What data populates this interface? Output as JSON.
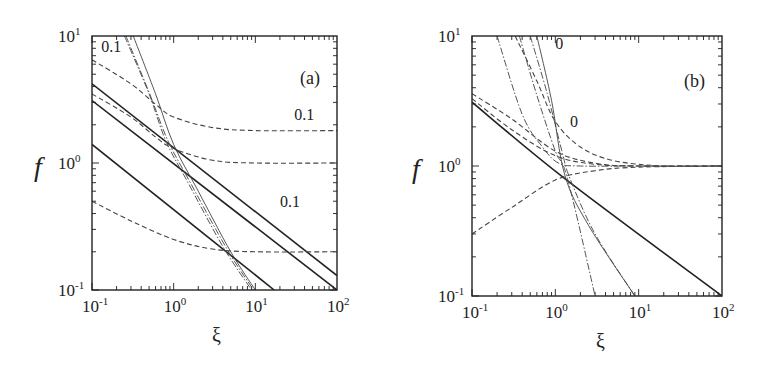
{
  "chart_data": [
    {
      "type": "line",
      "panel_label": "(a)",
      "xscale": "log",
      "yscale": "log",
      "xlabel": "ξ",
      "ylabel": "f",
      "xlim": [
        0.1,
        100
      ],
      "ylim": [
        0.1,
        10
      ],
      "xticks": [
        "10-1",
        "100",
        "101",
        "102"
      ],
      "yticks": [
        "10-1",
        "100",
        "101"
      ],
      "annotations": [
        {
          "text": "0.1",
          "x": 0.13,
          "y": 7.5
        },
        {
          "text": "0.1",
          "x": 30,
          "y": 2.2
        },
        {
          "text": "0.1",
          "x": 20,
          "y": 0.45
        }
      ],
      "series": [
        {
          "name": "solid-1",
          "style": "solid",
          "x": [
            0.1,
            100
          ],
          "y": [
            4.2,
            0.13
          ]
        },
        {
          "name": "solid-2",
          "style": "solid",
          "x": [
            0.1,
            100
          ],
          "y": [
            3.1,
            0.1
          ]
        },
        {
          "name": "solid-3",
          "style": "solid",
          "x": [
            0.1,
            17
          ],
          "y": [
            1.4,
            0.1
          ]
        },
        {
          "name": "dashed-1",
          "style": "dashed",
          "x": [
            0.1,
            0.3,
            0.6,
            1,
            3,
            10,
            100
          ],
          "y": [
            6.5,
            4.2,
            2.9,
            2.3,
            1.9,
            1.8,
            1.8
          ]
        },
        {
          "name": "dashed-2",
          "style": "dashed",
          "x": [
            0.1,
            0.3,
            0.6,
            1,
            3,
            10,
            100
          ],
          "y": [
            3.5,
            2.3,
            1.6,
            1.3,
            1.05,
            1.0,
            1.0
          ]
        },
        {
          "name": "dashed-3",
          "style": "dashed",
          "x": [
            0.1,
            0.3,
            1,
            3,
            10,
            100
          ],
          "y": [
            0.5,
            0.35,
            0.25,
            0.21,
            0.2,
            0.2
          ]
        },
        {
          "name": "dashdot-1",
          "style": "dashdot",
          "x": [
            0.25,
            0.5,
            0.8,
            1.5,
            4,
            9
          ],
          "y": [
            10,
            3.5,
            1.5,
            0.7,
            0.22,
            0.1
          ]
        },
        {
          "name": "dashdot-2",
          "style": "dashdot",
          "x": [
            0.26,
            0.5,
            0.85,
            1.6,
            4.5,
            9.5
          ],
          "y": [
            10,
            3.6,
            1.5,
            0.7,
            0.21,
            0.1
          ]
        },
        {
          "name": "thin-solid",
          "style": "thin",
          "x": [
            0.32,
            0.6,
            1.0,
            2,
            5,
            10
          ],
          "y": [
            10,
            3.5,
            1.4,
            0.6,
            0.2,
            0.1
          ]
        }
      ]
    },
    {
      "type": "line",
      "panel_label": "(b)",
      "xscale": "log",
      "yscale": "log",
      "xlabel": "ξ",
      "ylabel": "f",
      "xlim": [
        0.1,
        100
      ],
      "ylim": [
        0.1,
        10
      ],
      "xticks": [
        "10-1",
        "100",
        "101",
        "102"
      ],
      "yticks": [
        "10-1",
        "100",
        "101"
      ],
      "annotations": [
        {
          "text": "0",
          "x": 1.0,
          "y": 8.0
        },
        {
          "text": "0",
          "x": 1.5,
          "y": 2.0
        }
      ],
      "series": [
        {
          "name": "solid",
          "style": "solid",
          "x": [
            0.1,
            1.3,
            100
          ],
          "y": [
            3.1,
            0.8,
            0.1
          ]
        },
        {
          "name": "dashed-upper-1",
          "style": "dashed",
          "x": [
            0.33,
            0.6,
            1,
            2,
            5,
            20,
            100
          ],
          "y": [
            10,
            4.5,
            2.2,
            1.4,
            1.1,
            1.0,
            1.0
          ]
        },
        {
          "name": "dashed-upper-2",
          "style": "dashed",
          "x": [
            0.1,
            0.3,
            1,
            3,
            10,
            100
          ],
          "y": [
            3.6,
            2.3,
            1.3,
            1.05,
            1.0,
            1.0
          ]
        },
        {
          "name": "dashed-upper-3",
          "style": "dashed",
          "x": [
            0.1,
            0.3,
            1,
            3,
            10,
            100
          ],
          "y": [
            3.3,
            1.9,
            1.2,
            1.03,
            1.0,
            1.0
          ]
        },
        {
          "name": "dashed-lower",
          "style": "dashed",
          "x": [
            0.1,
            0.3,
            1,
            3,
            10,
            100
          ],
          "y": [
            0.3,
            0.48,
            0.78,
            0.92,
            0.98,
            1.0
          ]
        },
        {
          "name": "dashdot-1",
          "style": "dashdot",
          "x": [
            0.2,
            0.4,
            0.7,
            1.1,
            2,
            10,
            100
          ],
          "y": [
            10,
            2.5,
            1.4,
            1.05,
            1.0,
            1.0,
            1.0
          ]
        },
        {
          "name": "dashdot-2",
          "style": "dashdot",
          "x": [
            0.37,
            0.6,
            1.0,
            1.4,
            3.0
          ],
          "y": [
            10,
            3.5,
            1.3,
            0.8,
            0.1
          ]
        },
        {
          "name": "dashdot-3",
          "style": "dashdot",
          "x": [
            0.5,
            0.8,
            1.2,
            1.5,
            3,
            9
          ],
          "y": [
            10,
            3.6,
            1.3,
            0.8,
            0.3,
            0.1
          ]
        },
        {
          "name": "thin-solid",
          "style": "thin",
          "x": [
            0.6,
            0.9,
            1.3,
            2.5,
            9
          ],
          "y": [
            10,
            3.2,
            0.85,
            0.35,
            0.1
          ]
        }
      ]
    }
  ],
  "panels": {
    "a": {
      "label": "(a)",
      "xlabel": "ξ",
      "ylabel": "f",
      "xtick_base": [
        "10",
        "10",
        "10",
        "10"
      ],
      "xtick_exp": [
        "-1",
        "0",
        "1",
        "2"
      ],
      "ytick_base": [
        "10",
        "10",
        "10"
      ],
      "ytick_exp": [
        "-1",
        "0",
        "1"
      ],
      "ann": [
        "0.1",
        "0.1",
        "0.1"
      ]
    },
    "b": {
      "label": "(b)",
      "xlabel": "ξ",
      "ylabel": "f",
      "xtick_base": [
        "10",
        "10",
        "10",
        "10"
      ],
      "xtick_exp": [
        "-1",
        "0",
        "1",
        "2"
      ],
      "ytick_base": [
        "10",
        "10",
        "10"
      ],
      "ytick_exp": [
        "-1",
        "0",
        "1"
      ],
      "ann": [
        "0",
        "0"
      ]
    }
  }
}
